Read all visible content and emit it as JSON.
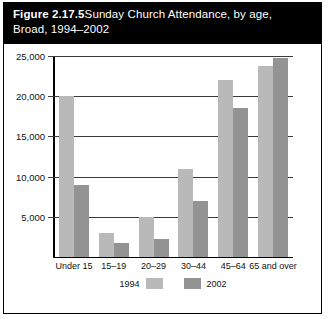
{
  "figure": {
    "number_label": "Figure 2.17.5",
    "title": "Sunday Church Attendance, by age,\nBroad, 1994–2002"
  },
  "chart_data": {
    "type": "bar",
    "title": "Sunday Church Attendance, by age, Broad, 1994–2002",
    "xlabel": "",
    "ylabel": "",
    "categories": [
      "Under 15",
      "15–19",
      "20–29",
      "30–44",
      "45–64",
      "65 and over"
    ],
    "series": [
      {
        "name": "1994",
        "color": "#b9b9b9",
        "values": [
          20000,
          3000,
          5000,
          11000,
          22000,
          23700
        ]
      },
      {
        "name": "2002",
        "color": "#939393",
        "values": [
          9000,
          1700,
          2300,
          7000,
          18500,
          24700
        ]
      }
    ],
    "ylim": [
      0,
      25000
    ],
    "yticks": [
      5000,
      10000,
      15000,
      20000,
      25000
    ],
    "ytick_labels": [
      "5,000",
      "10,000",
      "15,000",
      "20,000",
      "25,000"
    ],
    "grid": true,
    "legend_position": "bottom"
  }
}
